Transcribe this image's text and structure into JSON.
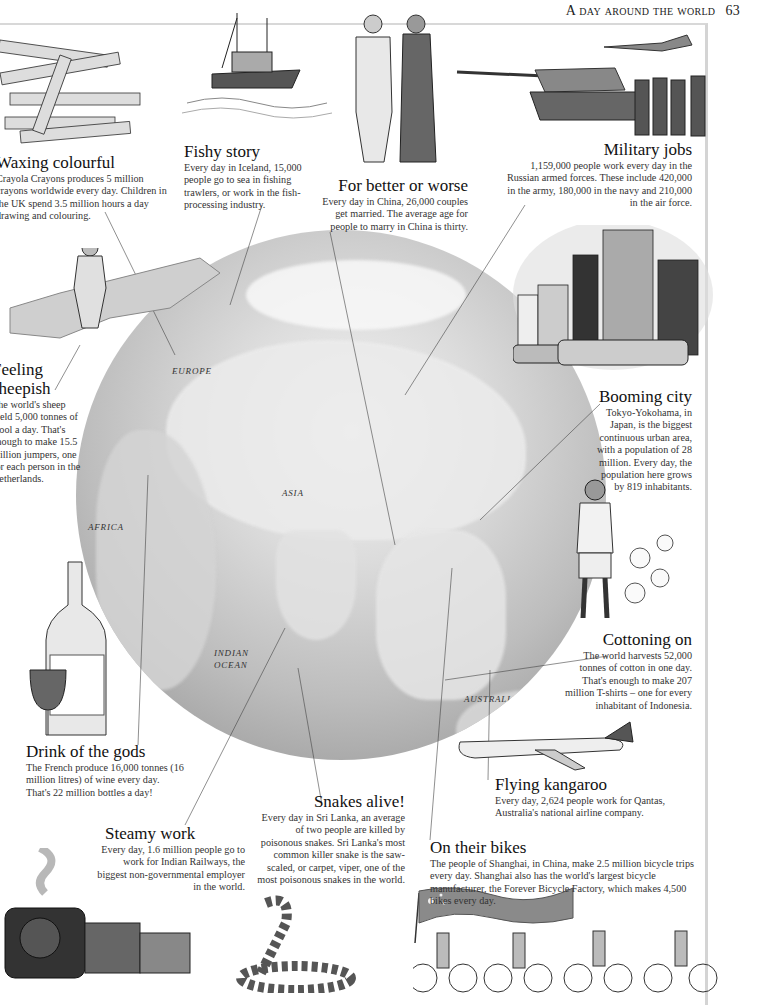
{
  "header": {
    "running_title": "A day around the world",
    "page_number": "63"
  },
  "map": {
    "labels": {
      "europe": "EUROPE",
      "asia": "ASIA",
      "africa": "AFRICA",
      "indian_ocean_1": "INDIAN",
      "indian_ocean_2": "OCEAN",
      "australia": "AUSTRALIA"
    }
  },
  "stories": {
    "waxing": {
      "title": "Waxing colourful",
      "body": "Crayola Crayons produces 5 million crayons worldwide every day. Children in the UK spend 3.5 million hours a day drawing and colouring."
    },
    "fishy": {
      "title": "Fishy story",
      "body": "Every day in Iceland, 15,000 people go to sea in fishing trawlers, or work in the fish-processing industry."
    },
    "better_worse": {
      "title": "For better or worse",
      "body": "Every day in China, 26,000 couples get married. The average age for people to marry in China is thirty."
    },
    "military": {
      "title": "Military jobs",
      "body": "1,159,000 people work every day in the Russian armed forces. These include 420,000 in the army, 180,000 in the navy and 210,000 in the air force."
    },
    "sheepish": {
      "title_line1": "Feeling",
      "title_line2": "sheepish",
      "body": "The world's sheep yield 5,000 tonnes of wool a day. That's enough to make 15.5 million jumpers, one for each person in the Netherlands."
    },
    "booming": {
      "title": "Booming city",
      "body": "Tokyo-Yokohama, in Japan, is the biggest continuous urban area, with a population of 28 million. Every day, the population here grows by 819 inhabitants."
    },
    "cottoning": {
      "title": "Cottoning on",
      "body": "The world harvests 52,000 tonnes of cotton in one day. That's enough to make 207 million T-shirts – one for every inhabitant of Indonesia."
    },
    "drink": {
      "title": "Drink of the gods",
      "body": "The French produce 16,000 tonnes (16 million litres) of wine every day. That's 22 million bottles a day!"
    },
    "kangaroo": {
      "title": "Flying kangaroo",
      "body": "Every day, 2,624 people work for Qantas, Australia's national airline company."
    },
    "snakes": {
      "title": "Snakes alive!",
      "body": "Every day in Sri Lanka, an average of two people are killed by poisonous snakes. Sri Lanka's most common killer snake is the saw-scaled, or carpet, viper, one of the most poisonous snakes in the world."
    },
    "steamy": {
      "title": "Steamy work",
      "body": "Every day, 1.6 million people go to work for Indian Railways, the biggest non-governmental employer in the world."
    },
    "bikes": {
      "title": "On their bikes",
      "body": "The people of Shanghai, in China, make 2.5 million bicycle trips every day. Shanghai also has the world's largest bicycle manufacturer, the Forever Bicycle Factory, which makes 4,500 bikes every day."
    }
  },
  "illustrations": {
    "crayons": "crayons",
    "trawler": "fishing trawler",
    "couple": "wedding couple",
    "jet": "fighter jet",
    "tank": "tank",
    "soldiers": "soldiers",
    "farmer": "farmer with sheep",
    "city": "Tokyo buildings and taxis",
    "cotton_picker": "cotton picker",
    "wine": "wine bottle and glass",
    "airplane": "Qantas airplane",
    "train": "steam locomotive",
    "snake": "snake",
    "flag": "Chinese flag",
    "cyclists": "cyclists"
  },
  "colors": {
    "text": "#1a1a1a",
    "body_text": "#333333",
    "globe_light": "#f4f4f4",
    "globe_dark": "#8a8a8a",
    "flag_red": "#8a8a8a"
  }
}
